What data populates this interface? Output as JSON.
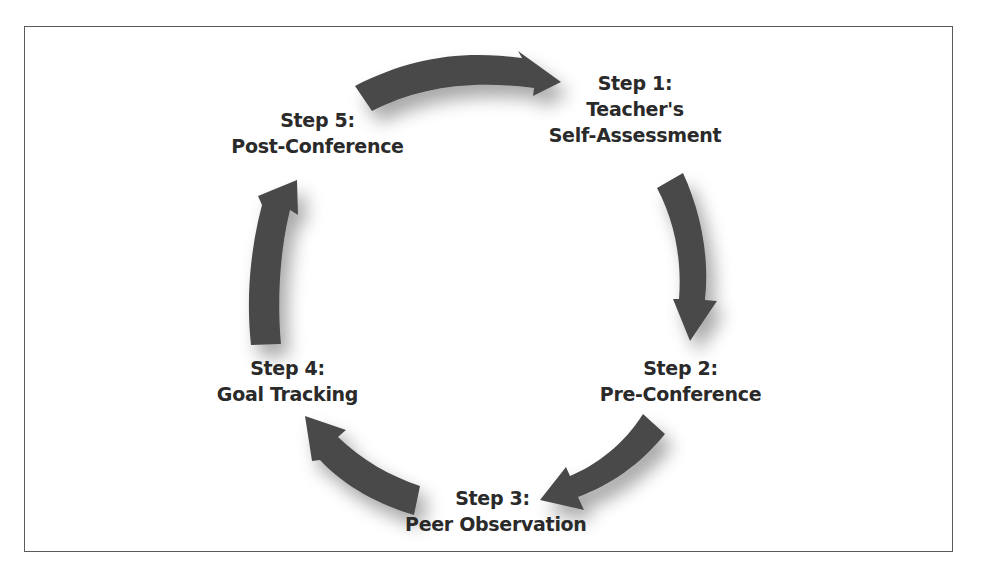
{
  "diagram": {
    "type": "cycle",
    "arrow_color": "#4a4a4a",
    "frame_color": "#5a5a5a",
    "steps": [
      {
        "step": "Step 1:",
        "lines": [
          "Teacher's",
          "Self-Assessment"
        ]
      },
      {
        "step": "Step 2:",
        "lines": [
          "Pre-Conference"
        ]
      },
      {
        "step": "Step 3:",
        "lines": [
          "Peer Observation"
        ]
      },
      {
        "step": "Step 4:",
        "lines": [
          "Goal Tracking"
        ]
      },
      {
        "step": "Step 5:",
        "lines": [
          "Post-Conference"
        ]
      }
    ],
    "flow": [
      "Step 5 → Step 1",
      "Step 1 → Step 2",
      "Step 2 → Step 3",
      "Step 3 → Step 4",
      "Step 4 → Step 5"
    ]
  }
}
